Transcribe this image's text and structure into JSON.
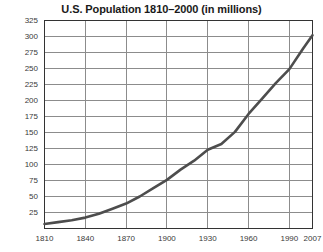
{
  "chart_data": {
    "type": "line",
    "title": "U.S. Population 1810–2000 (in millions)",
    "xlabel": "",
    "ylabel": "",
    "xlim": [
      1810,
      2007
    ],
    "ylim": [
      0,
      325
    ],
    "grid": true,
    "legend": null,
    "xticks": [
      1810,
      1840,
      1870,
      1900,
      1930,
      1960,
      1990,
      2007
    ],
    "xtick_labels": [
      "1810",
      "1840",
      "1870",
      "1900",
      "1930",
      "1960",
      "1990",
      "2007"
    ],
    "yticks": [
      25,
      50,
      75,
      100,
      125,
      150,
      175,
      200,
      225,
      250,
      275,
      300,
      325
    ],
    "ytick_labels": [
      "25",
      "50",
      "75",
      "100",
      "125",
      "150",
      "175",
      "200",
      "225",
      "250",
      "275",
      "300",
      "325"
    ],
    "line_color": "#4d4d4d",
    "line_width": 2.6,
    "x": [
      1810,
      1820,
      1830,
      1840,
      1850,
      1860,
      1870,
      1880,
      1890,
      1900,
      1910,
      1920,
      1930,
      1940,
      1950,
      1960,
      1970,
      1980,
      1990,
      2000,
      2007
    ],
    "values": [
      7,
      10,
      13,
      17,
      23,
      31,
      39,
      50,
      63,
      76,
      92,
      106,
      123,
      132,
      151,
      179,
      203,
      227,
      249,
      281,
      302
    ],
    "series": [
      {
        "name": "U.S. Population",
        "values": [
          7,
          10,
          13,
          17,
          23,
          31,
          39,
          50,
          63,
          76,
          92,
          106,
          123,
          132,
          151,
          179,
          203,
          227,
          249,
          281,
          302
        ]
      }
    ]
  },
  "axes": {
    "frame_color": "#333333",
    "grid_color": "#8c8c8c"
  }
}
